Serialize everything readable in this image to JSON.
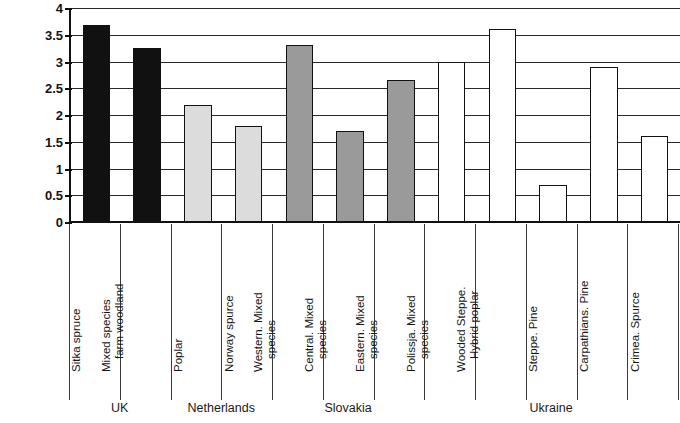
{
  "chart_data": {
    "type": "bar",
    "title": "",
    "xlabel": "",
    "ylabel": "carbon sequestration rates, tCha-1 yr-1",
    "ylabel_parts": {
      "base": "carbon sequestration rates, tCha",
      "sup1": "-1",
      "mid": " yr",
      "sup2": "-1"
    },
    "ylim": [
      0,
      4
    ],
    "ytick_labels": [
      "4",
      "3.5",
      "3",
      "2.5",
      "2",
      "1.5",
      "1",
      "0.5",
      "0"
    ],
    "ytick_values": [
      4,
      3.5,
      3,
      2.5,
      2,
      1.5,
      1,
      0.5,
      0
    ],
    "grid": true,
    "legend": "none",
    "categories": [
      "Sitka spruce",
      "Mixed species farm woodland",
      "Poplar",
      "Norway spurce",
      "Western. Mixed species",
      "Central. Mixed species",
      "Eastern. Mixed species",
      "Polissja. Mixed species",
      "Wooded Steppe. Hybrid poplar",
      "Steppe. Pine",
      "Carpathians. Pine",
      "Crimea. Spurce"
    ],
    "category_lines": [
      [
        "Sitka spruce"
      ],
      [
        "Mixed species",
        "farm woodland"
      ],
      [
        "Poplar"
      ],
      [
        "Norway spurce"
      ],
      [
        "Western. Mixed",
        "species"
      ],
      [
        "Central. Mixed",
        "species"
      ],
      [
        "Eastern. Mixed",
        "species"
      ],
      [
        "Polissja. Mixed",
        "species"
      ],
      [
        "Wooded Steppe.",
        "Hybrid poplar"
      ],
      [
        "Steppe. Pine"
      ],
      [
        "Carpathians. Pine"
      ],
      [
        "Crimea. Spurce"
      ]
    ],
    "values": [
      3.68,
      3.25,
      2.18,
      1.8,
      3.3,
      1.7,
      2.65,
      3.0,
      3.6,
      0.7,
      2.9,
      1.6
    ],
    "bar_colors": [
      "#111111",
      "#111111",
      "#dcdcdc",
      "#dcdcdc",
      "#9a9a9a",
      "#9a9a9a",
      "#9a9a9a",
      "#ffffff",
      "#ffffff",
      "#ffffff",
      "#ffffff",
      "#ffffff"
    ],
    "bar_edge_color": "#111111",
    "groups": [
      {
        "label": "UK",
        "start": 0,
        "end": 1
      },
      {
        "label": "Netherlands",
        "start": 2,
        "end": 3
      },
      {
        "label": "Slovakia",
        "start": 4,
        "end": 6
      },
      {
        "label": "Ukraine",
        "start": 7,
        "end": 11
      }
    ]
  }
}
